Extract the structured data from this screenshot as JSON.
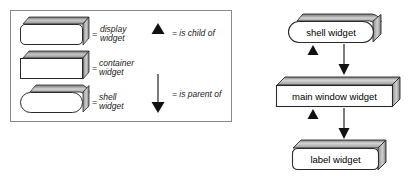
{
  "diagram": {
    "legend": {
      "name": "legend-box",
      "equals_sign": "=",
      "shapes": [
        {
          "key": "display",
          "shape": "rounded-3d-box",
          "label_line1": "display",
          "label_line2": "widget"
        },
        {
          "key": "container",
          "shape": "sharp-3d-box",
          "label_line1": "container",
          "label_line2": "widget"
        },
        {
          "key": "shell",
          "shape": "pill-3d-box",
          "label_line1": "shell",
          "label_line2": "widget"
        }
      ],
      "relations": [
        {
          "key": "child",
          "glyph": "up-triangle-arrowhead",
          "label": "= is child of"
        },
        {
          "key": "parent",
          "glyph": "down-arrow-with-shaft",
          "label": "= is parent of"
        }
      ]
    },
    "hierarchy": {
      "nodes": [
        {
          "id": "shell",
          "label": "shell widget",
          "shape": "pill-3d-box"
        },
        {
          "id": "main-window",
          "label": "main window widget",
          "shape": "sharp-3d-box"
        },
        {
          "id": "label",
          "label": "label widget",
          "shape": "rounded-3d-box"
        }
      ],
      "edges": [
        {
          "from": "main-window",
          "to": "shell",
          "relation": "is child of",
          "glyph": "up-triangle-arrowhead"
        },
        {
          "from": "shell",
          "to": "main-window",
          "relation": "is parent of",
          "glyph": "down-arrow-with-shaft"
        },
        {
          "from": "label",
          "to": "main-window",
          "relation": "is child of",
          "glyph": "up-triangle-arrowhead"
        },
        {
          "from": "main-window",
          "to": "label",
          "relation": "is parent of",
          "glyph": "down-arrow-with-shaft"
        }
      ]
    },
    "colors": {
      "stroke": "#2b2b2b",
      "face": "#ffffff",
      "shade_light": "#f2f2f2",
      "shade_mid": "#b8b8b8",
      "shade_dark": "#6e6e6e",
      "legend_border": "#8a8a8a",
      "text": "#1a1a1a"
    }
  }
}
